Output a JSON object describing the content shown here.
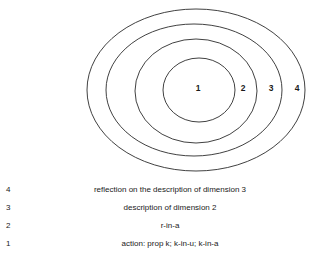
{
  "diagram": {
    "name": "nested-dimensions-ellipses",
    "stroke_color": "#2b2b2b",
    "background_color": "#ffffff",
    "rings": [
      {
        "label": "1",
        "label_x": 198,
        "label_y": 88,
        "cx": 199,
        "cy": 90,
        "rx": 36,
        "ry": 32
      },
      {
        "label": "2",
        "label_x": 243,
        "label_y": 88,
        "cx": 196,
        "cy": 91,
        "rx": 61,
        "ry": 52
      },
      {
        "label": "3",
        "label_x": 271,
        "label_y": 88,
        "cx": 194,
        "cy": 90,
        "rx": 88,
        "ry": 66
      },
      {
        "label": "4",
        "label_x": 297,
        "label_y": 88,
        "cx": 196,
        "cy": 90,
        "rx": 109,
        "ry": 81
      }
    ]
  },
  "legend": {
    "rows": [
      {
        "number": "4",
        "text": "reflection on the description of dimension 3"
      },
      {
        "number": "3",
        "text": "description of dimension 2"
      },
      {
        "number": "2",
        "text": "r-in-a"
      },
      {
        "number": "1",
        "text": "action: prop k; k-in-u; k-in-a"
      }
    ]
  }
}
